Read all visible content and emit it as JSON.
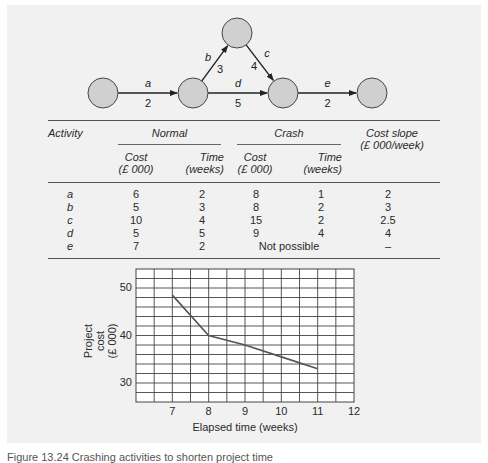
{
  "network": {
    "nodes": [
      {
        "id": 1,
        "cx": 103,
        "cy": 93
      },
      {
        "id": 2,
        "cx": 193,
        "cy": 93
      },
      {
        "id": 3,
        "cx": 237,
        "cy": 33
      },
      {
        "id": 4,
        "cx": 283,
        "cy": 93
      },
      {
        "id": 5,
        "cx": 372,
        "cy": 93
      }
    ],
    "node_radius": 15,
    "node_fill": "#d0d0d0",
    "edges": [
      {
        "activity": "a",
        "duration": "2",
        "from": 1,
        "to": 2
      },
      {
        "activity": "b",
        "duration": "3",
        "from": 2,
        "to": 3
      },
      {
        "activity": "c",
        "duration": "4",
        "from": 3,
        "to": 4
      },
      {
        "activity": "d",
        "duration": "5",
        "from": 2,
        "to": 4
      },
      {
        "activity": "e",
        "duration": "2",
        "from": 4,
        "to": 5
      }
    ]
  },
  "table": {
    "headers": {
      "activity": "Activity",
      "normal": "Normal",
      "crash": "Crash",
      "cost_slope_line1": "Cost slope",
      "cost_slope_line2": "(£ 000/week)",
      "cost_line1": "Cost",
      "cost_line2": "(£ 000)",
      "time_line1": "Time",
      "time_line2": "(weeks)"
    },
    "rows": [
      {
        "activity": "a",
        "normal_cost": "6",
        "normal_time": "2",
        "crash_cost": "8",
        "crash_time": "1",
        "cost_slope": "2"
      },
      {
        "activity": "b",
        "normal_cost": "5",
        "normal_time": "3",
        "crash_cost": "8",
        "crash_time": "2",
        "cost_slope": "3"
      },
      {
        "activity": "c",
        "normal_cost": "10",
        "normal_time": "4",
        "crash_cost": "15",
        "crash_time": "2",
        "cost_slope": "2.5"
      },
      {
        "activity": "d",
        "normal_cost": "5",
        "normal_time": "5",
        "crash_cost": "9",
        "crash_time": "4",
        "cost_slope": "4"
      },
      {
        "activity": "e",
        "normal_cost": "7",
        "normal_time": "2",
        "crash_note": "Not possible",
        "cost_slope": "–"
      }
    ]
  },
  "chart_data": {
    "type": "line",
    "title": "",
    "xlabel": "Elapsed time (weeks)",
    "ylabel_line1": "Project cost",
    "ylabel_line2": "(£ 000)",
    "x": [
      7,
      8,
      9,
      10,
      11
    ],
    "values": [
      48.5,
      40,
      38,
      35.5,
      33
    ],
    "xlim": [
      6,
      12
    ],
    "ylim": [
      26,
      54
    ],
    "x_ticks": [
      "7",
      "8",
      "9",
      "10",
      "11",
      "12"
    ],
    "y_ticks": [
      "30",
      "40",
      "50"
    ],
    "grid": true,
    "x_grid_step": 0.5,
    "y_grid_step": 2,
    "line_color": "#555555"
  },
  "caption": "Figure 13.24  Crashing activities to shorten project time"
}
